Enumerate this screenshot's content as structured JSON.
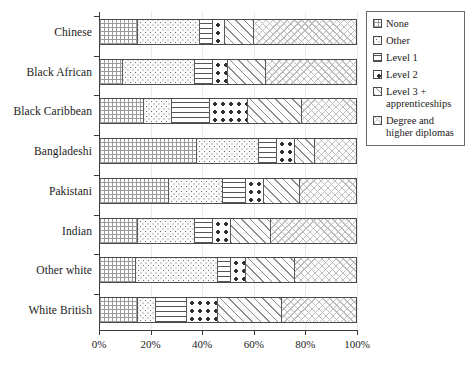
{
  "chart_data": {
    "type": "bar",
    "orientation": "horizontal",
    "stacked": true,
    "title": "",
    "xlabel": "",
    "ylabel": "",
    "xlim": [
      0,
      100
    ],
    "xticks": [
      "0%",
      "20%",
      "40%",
      "60%",
      "80%",
      "100%"
    ],
    "xtick_values": [
      0,
      20,
      40,
      60,
      80,
      100
    ],
    "grid": true,
    "legend_position": "right",
    "categories": [
      "Chinese",
      "Black African",
      "Black Caribbean",
      "Bangladeshi",
      "Pakistani",
      "Indian",
      "Other white",
      "White British"
    ],
    "series": [
      {
        "name": "None",
        "pattern": "fine-grid",
        "values": [
          15,
          9,
          17,
          38,
          27,
          15,
          14,
          15
        ]
      },
      {
        "name": "Other",
        "pattern": "dense-dots",
        "values": [
          24,
          28,
          11,
          24,
          21,
          22,
          32,
          7
        ]
      },
      {
        "name": "Level 1",
        "pattern": "horizontal-lines",
        "values": [
          5,
          7,
          15,
          7,
          9,
          7,
          5,
          12
        ]
      },
      {
        "name": "Level 2",
        "pattern": "bold-dots",
        "values": [
          5,
          6,
          15,
          7,
          7,
          7,
          6,
          12
        ]
      },
      {
        "name": "Level 3 + apprenticeships",
        "pattern": "diagonal-stripes",
        "values": [
          11,
          15,
          21,
          8,
          14,
          16,
          19,
          25
        ]
      },
      {
        "name": "Degree and higher diplomas",
        "pattern": "light-crosshatch",
        "values": [
          40,
          35,
          21,
          16,
          22,
          33,
          24,
          29
        ]
      }
    ]
  },
  "legend": {
    "items": [
      {
        "label": "None"
      },
      {
        "label": "Other"
      },
      {
        "label": "Level 1"
      },
      {
        "label": "Level 2"
      },
      {
        "label": "Level 3 +\napprenticeships"
      },
      {
        "label": "Degree and\nhigher diplomas"
      }
    ]
  },
  "colors": {
    "axis": "#3a3a3a",
    "bar_border": "#4a4a4a",
    "gridline": "#e9e9e9",
    "text": "#1a1a1a",
    "background": "#ffffff"
  }
}
